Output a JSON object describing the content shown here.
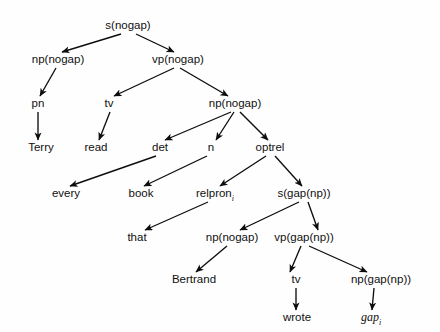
{
  "figure": {
    "background_color": "#fffefe",
    "line_color": "#0d0d0d",
    "text_color": "#101010",
    "width": 440,
    "height": 332
  },
  "nodes": [
    {
      "id": "s_root",
      "label": "s(nogap)",
      "x": 128,
      "y": 29,
      "sub": "",
      "italic": false
    },
    {
      "id": "np_subj",
      "label": "np(nogap)",
      "x": 58,
      "y": 63,
      "sub": "",
      "italic": false
    },
    {
      "id": "vp_main",
      "label": "vp(nogap)",
      "x": 178,
      "y": 63,
      "sub": "",
      "italic": false
    },
    {
      "id": "pn",
      "label": "pn",
      "x": 38,
      "y": 107,
      "sub": "",
      "italic": false
    },
    {
      "id": "tv_read",
      "label": "tv",
      "x": 109,
      "y": 107,
      "sub": "",
      "italic": false
    },
    {
      "id": "np_obj",
      "label": "np(nogap)",
      "x": 235,
      "y": 107,
      "sub": "",
      "italic": false
    },
    {
      "id": "terry",
      "label": "Terry",
      "x": 41,
      "y": 151,
      "sub": "",
      "italic": false
    },
    {
      "id": "read",
      "label": "read",
      "x": 96,
      "y": 151,
      "sub": "",
      "italic": false
    },
    {
      "id": "det",
      "label": "det",
      "x": 160,
      "y": 151,
      "sub": "",
      "italic": false
    },
    {
      "id": "n",
      "label": "n",
      "x": 211,
      "y": 151,
      "sub": "",
      "italic": false
    },
    {
      "id": "optrel",
      "label": "optrel",
      "x": 270,
      "y": 151,
      "sub": "",
      "italic": false
    },
    {
      "id": "every",
      "label": "every",
      "x": 66,
      "y": 197,
      "sub": "",
      "italic": false
    },
    {
      "id": "book",
      "label": "book",
      "x": 141,
      "y": 197,
      "sub": "",
      "italic": false
    },
    {
      "id": "relpron",
      "label": "relpron",
      "x": 215,
      "y": 197,
      "sub": "i",
      "italic": false
    },
    {
      "id": "s_gap",
      "label": "s(gap(np))",
      "x": 304,
      "y": 197,
      "sub": "",
      "italic": false
    },
    {
      "id": "that",
      "label": "that",
      "x": 137,
      "y": 241,
      "sub": "",
      "italic": false
    },
    {
      "id": "np_rel_subj",
      "label": "np(nogap)",
      "x": 232,
      "y": 241,
      "sub": "",
      "italic": false
    },
    {
      "id": "vp_gap",
      "label": "vp(gap(np))",
      "x": 304,
      "y": 241,
      "sub": "",
      "italic": false
    },
    {
      "id": "bertrand",
      "label": "Bertrand",
      "x": 194,
      "y": 283,
      "sub": "",
      "italic": false
    },
    {
      "id": "tv_wrote",
      "label": "tv",
      "x": 296,
      "y": 283,
      "sub": "",
      "italic": false
    },
    {
      "id": "np_gap",
      "label": "np(gap(np))",
      "x": 381,
      "y": 283,
      "sub": "",
      "italic": false
    },
    {
      "id": "wrote",
      "label": "wrote",
      "x": 297,
      "y": 321,
      "sub": "",
      "italic": false
    },
    {
      "id": "gap",
      "label": "gap",
      "x": 371,
      "y": 321,
      "sub": "i",
      "italic": true
    }
  ],
  "edges": [
    {
      "from": "s_root",
      "to": "np_subj",
      "x1": 121,
      "y1": 34,
      "x2": 62,
      "y2": 52
    },
    {
      "from": "s_root",
      "to": "vp_main",
      "x1": 136,
      "y1": 34,
      "x2": 174,
      "y2": 52
    },
    {
      "from": "np_subj",
      "to": "pn",
      "x1": 56,
      "y1": 68,
      "x2": 40,
      "y2": 96
    },
    {
      "from": "vp_main",
      "to": "tv_read",
      "x1": 174,
      "y1": 68,
      "x2": 114,
      "y2": 96
    },
    {
      "from": "vp_main",
      "to": "np_obj",
      "x1": 180,
      "y1": 68,
      "x2": 228,
      "y2": 96
    },
    {
      "from": "pn",
      "to": "terry",
      "x1": 38,
      "y1": 112,
      "x2": 38,
      "y2": 140
    },
    {
      "from": "tv_read",
      "to": "read",
      "x1": 110,
      "y1": 112,
      "x2": 99,
      "y2": 140
    },
    {
      "from": "np_obj",
      "to": "det",
      "x1": 231,
      "y1": 112,
      "x2": 165,
      "y2": 140
    },
    {
      "from": "np_obj",
      "to": "n",
      "x1": 234,
      "y1": 112,
      "x2": 216,
      "y2": 140
    },
    {
      "from": "np_obj",
      "to": "optrel",
      "x1": 240,
      "y1": 112,
      "x2": 268,
      "y2": 140
    },
    {
      "from": "det",
      "to": "every",
      "x1": 156,
      "y1": 156,
      "x2": 70,
      "y2": 186
    },
    {
      "from": "n",
      "to": "book",
      "x1": 207,
      "y1": 156,
      "x2": 144,
      "y2": 186
    },
    {
      "from": "optrel",
      "to": "relpron",
      "x1": 266,
      "y1": 156,
      "x2": 220,
      "y2": 186
    },
    {
      "from": "optrel",
      "to": "s_gap",
      "x1": 275,
      "y1": 156,
      "x2": 302,
      "y2": 186
    },
    {
      "from": "relpron",
      "to": "that",
      "x1": 208,
      "y1": 202,
      "x2": 145,
      "y2": 230
    },
    {
      "from": "s_gap",
      "to": "np_rel_subj",
      "x1": 299,
      "y1": 202,
      "x2": 240,
      "y2": 230
    },
    {
      "from": "s_gap",
      "to": "vp_gap",
      "x1": 308,
      "y1": 202,
      "x2": 318,
      "y2": 230
    },
    {
      "from": "np_rel_subj",
      "to": "bertrand",
      "x1": 227,
      "y1": 246,
      "x2": 196,
      "y2": 272
    },
    {
      "from": "vp_gap",
      "to": "tv_wrote",
      "x1": 301,
      "y1": 246,
      "x2": 290,
      "y2": 272
    },
    {
      "from": "vp_gap",
      "to": "np_gap",
      "x1": 309,
      "y1": 246,
      "x2": 367,
      "y2": 272
    },
    {
      "from": "tv_wrote",
      "to": "wrote",
      "x1": 296,
      "y1": 288,
      "x2": 296,
      "y2": 310
    },
    {
      "from": "np_gap",
      "to": "gap",
      "x1": 374,
      "y1": 288,
      "x2": 372,
      "y2": 310
    }
  ]
}
